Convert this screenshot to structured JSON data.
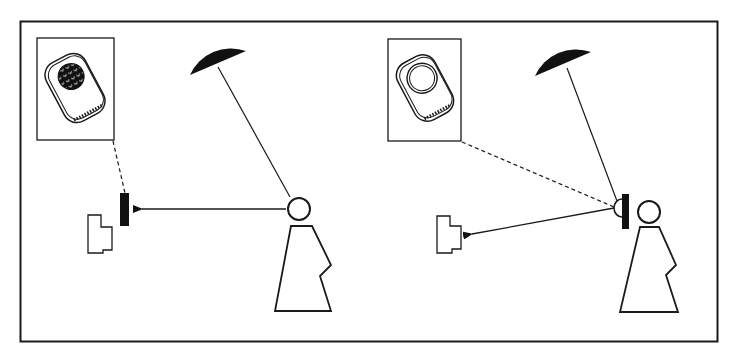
{
  "diagram": {
    "title": "",
    "colors": {
      "ink": "#1a1a1a",
      "fill": "#111111",
      "background": "#ffffff"
    },
    "panels": [
      {
        "id": "left",
        "description": "Light meter reading reflected light from subject toward camera",
        "inset_icon": "light-meter-reflected-icon",
        "meter_position": "near-camera",
        "arrow_direction": "subject-to-meter"
      },
      {
        "id": "right",
        "description": "Incident light meter at subject pointed toward camera",
        "inset_icon": "light-meter-incident-dome-icon",
        "meter_position": "at-subject",
        "arrow_direction": "meter-to-camera"
      }
    ]
  }
}
